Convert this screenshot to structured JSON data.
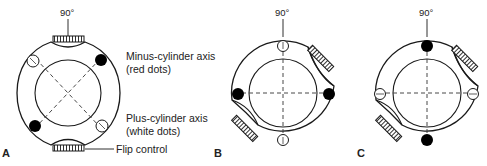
{
  "figure": {
    "panels": [
      {
        "id": "A",
        "label": "A",
        "degree_label": "90°",
        "annotations": {
          "minus_axis_line1": "Minus-cylinder axis",
          "minus_axis_line2": "(red dots)",
          "plus_axis_line1": "Plus-cylinder axis",
          "plus_axis_line2": "(white dots)",
          "flip_control": "Flip control"
        },
        "axes_orientation": "oblique (45° / 135°)",
        "dots": {
          "filled": [
            "upper-right",
            "lower-left"
          ],
          "open": [
            "upper-left",
            "lower-right"
          ]
        }
      },
      {
        "id": "B",
        "label": "B",
        "degree_label": "90°",
        "axes_orientation": "vertical / horizontal",
        "dots": {
          "filled": [
            "left",
            "right"
          ],
          "open": [
            "top",
            "bottom"
          ]
        }
      },
      {
        "id": "C",
        "label": "C",
        "degree_label": "90°",
        "axes_orientation": "vertical / horizontal",
        "dots": {
          "filled": [
            "top",
            "bottom"
          ],
          "open": [
            "left",
            "right"
          ]
        }
      }
    ],
    "colors": {
      "line": "#1a1a1a",
      "filled_dot": "#000000",
      "open_dot": "#ffffff",
      "background": "#ffffff"
    }
  }
}
